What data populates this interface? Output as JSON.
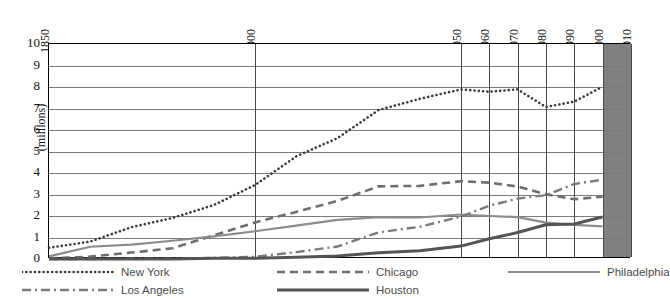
{
  "chart_data": {
    "type": "line",
    "title": "",
    "xlabel": "",
    "ylabel": "(millions)",
    "ylim": [
      0,
      10
    ],
    "ytick_labels": [
      "10",
      "9",
      "8",
      "7",
      "6",
      "5",
      "4",
      "3",
      "2",
      "1",
      "0"
    ],
    "yticks": [
      10,
      9,
      8,
      7,
      6,
      5,
      4,
      3,
      2,
      1,
      0
    ],
    "x": [
      1850,
      1860,
      1870,
      1880,
      1890,
      1900,
      1910,
      1920,
      1930,
      1940,
      1950,
      1960,
      1970,
      1980,
      1990,
      2000
    ],
    "xtick_labels": [
      "1850",
      "1900",
      "1950",
      "1960",
      "1970",
      "1980",
      "1990",
      "2000",
      "2010"
    ],
    "xticks": [
      1850,
      1900,
      1950,
      1960,
      1970,
      1980,
      1990,
      2000,
      2010
    ],
    "grid": true,
    "legend_position": "bottom",
    "projection_band": {
      "from": 2000,
      "to": 2010,
      "color": "#808080"
    },
    "series": [
      {
        "name": "New York",
        "style": "dotted",
        "color": "#3c3c3c",
        "values": [
          0.52,
          0.81,
          1.48,
          1.91,
          2.51,
          3.44,
          4.77,
          5.62,
          6.93,
          7.45,
          7.89,
          7.78,
          7.89,
          7.07,
          7.32,
          8.01
        ]
      },
      {
        "name": "Chicago",
        "style": "dashed",
        "color": "#6e6e6e",
        "values": [
          0.03,
          0.11,
          0.3,
          0.5,
          1.1,
          1.7,
          2.19,
          2.7,
          3.38,
          3.4,
          3.62,
          3.55,
          3.37,
          3.01,
          2.78,
          2.9
        ]
      },
      {
        "name": "Philadelphia",
        "style": "solid-light",
        "color": "#8c8c8c",
        "values": [
          0.12,
          0.57,
          0.67,
          0.85,
          1.05,
          1.29,
          1.55,
          1.82,
          1.95,
          1.93,
          2.07,
          2.0,
          1.95,
          1.69,
          1.59,
          1.52
        ]
      },
      {
        "name": "Los Angeles",
        "style": "dash-dot",
        "color": "#7a7a7a",
        "values": [
          0.0,
          0.0,
          0.01,
          0.01,
          0.05,
          0.1,
          0.32,
          0.58,
          1.24,
          1.5,
          1.97,
          2.48,
          2.81,
          2.97,
          3.49,
          3.69
        ]
      },
      {
        "name": "Houston",
        "style": "solid-heavy",
        "color": "#555555",
        "values": [
          0.0,
          0.0,
          0.0,
          0.0,
          0.03,
          0.04,
          0.08,
          0.14,
          0.29,
          0.38,
          0.6,
          0.94,
          1.23,
          1.59,
          1.63,
          1.95
        ]
      }
    ]
  }
}
